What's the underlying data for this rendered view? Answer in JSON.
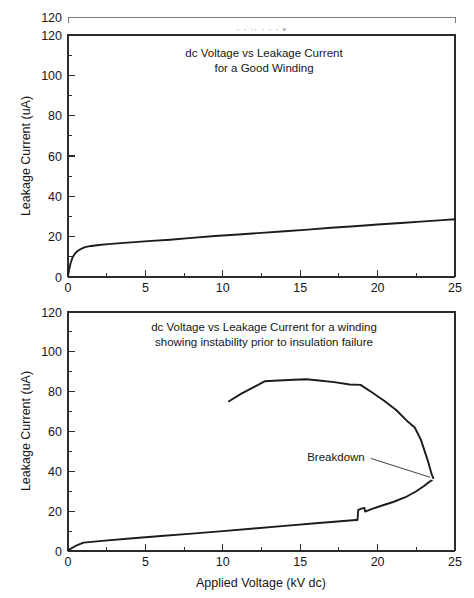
{
  "figure": {
    "background": "#ffffff",
    "ink_color": "#1c1c1c",
    "panel_count": 2
  },
  "chart_data": [
    {
      "type": "line",
      "id": "good-winding",
      "title": "dc Voltage vs Leakage Current\nfor a Good Winding",
      "title_line1": "dc Voltage vs Leakage Current",
      "title_line2": "for a Good Winding",
      "xlabel": "",
      "ylabel": "Leakage Current (uA)",
      "xlim": [
        0,
        25
      ],
      "ylim": [
        0,
        120
      ],
      "xticks": [
        0,
        5,
        10,
        15,
        20,
        25
      ],
      "xticklabels": [
        "0",
        "5",
        "10",
        "15",
        "20",
        "25"
      ],
      "yticks": [
        0,
        20,
        40,
        60,
        80,
        100,
        120
      ],
      "yticklabels": [
        "0",
        "20",
        "40",
        "60",
        "80",
        "100",
        "120"
      ],
      "minor_xticks": [
        2.5,
        7.5,
        12.5,
        17.5,
        22.5
      ],
      "minor_yticks": [
        10,
        30,
        50,
        70,
        90,
        110
      ],
      "grid": false,
      "legend": null,
      "series": [
        {
          "name": "Good winding leakage current",
          "x": [
            0.0,
            0.08,
            0.18,
            0.3,
            0.45,
            0.62,
            0.85,
            1.1,
            1.5,
            2.0,
            2.6,
            3.4,
            4.3,
            5.4,
            6.6,
            8.0,
            9.5,
            11.0,
            12.5,
            14.0,
            15.5,
            17.0,
            18.5,
            20.0,
            21.5,
            23.0,
            24.2,
            25.0
          ],
          "y": [
            0.4,
            4.0,
            7.2,
            9.8,
            11.6,
            12.9,
            14.0,
            14.8,
            15.4,
            15.9,
            16.3,
            16.8,
            17.3,
            17.9,
            18.5,
            19.4,
            20.3,
            21.1,
            21.9,
            22.7,
            23.5,
            24.4,
            25.2,
            26.0,
            26.8,
            27.6,
            28.2,
            28.6
          ]
        }
      ]
    },
    {
      "type": "line",
      "id": "unstable-winding",
      "title": "dc Voltage vs Leakage Current for a winding\nshowing instability prior to insulation failure",
      "title_line1": "dc Voltage vs Leakage Current for a winding",
      "title_line2": "showing instability prior to insulation failure",
      "xlabel": "Applied Voltage (kV dc)",
      "ylabel": "Leakage Current (uA)",
      "xlim": [
        0,
        25
      ],
      "ylim": [
        0,
        120
      ],
      "xticks": [
        0,
        5,
        10,
        15,
        20,
        25
      ],
      "xticklabels": [
        "0",
        "5",
        "10",
        "15",
        "20",
        "25"
      ],
      "yticks": [
        0,
        20,
        40,
        60,
        80,
        100,
        120
      ],
      "yticklabels": [
        "0",
        "20",
        "40",
        "60",
        "80",
        "100",
        "120"
      ],
      "minor_xticks": [
        2.5,
        7.5,
        12.5,
        17.5,
        22.5
      ],
      "minor_yticks": [
        10,
        30,
        50,
        70,
        90,
        110
      ],
      "grid": false,
      "legend": null,
      "annotations": [
        {
          "text": "Breakdown",
          "x": 19.3,
          "y": 45.0,
          "points_to_x": 23.4,
          "points_to_y": 37.0
        }
      ],
      "series": [
        {
          "name": "Lower branch - rising leakage with instability step",
          "x": [
            0.0,
            0.45,
            1.0,
            2.2,
            4.0,
            6.0,
            8.0,
            10.0,
            12.0,
            14.0,
            16.0,
            17.6,
            18.6,
            18.7,
            18.75,
            19.0,
            19.15,
            19.2,
            19.6,
            20.2,
            21.0,
            21.8,
            22.5,
            23.0,
            23.35,
            23.5
          ],
          "y": [
            0.3,
            2.4,
            4.2,
            5.1,
            6.3,
            7.5,
            8.7,
            10.0,
            11.3,
            12.6,
            13.9,
            14.9,
            15.6,
            15.6,
            20.6,
            21.4,
            21.6,
            19.8,
            21.0,
            22.6,
            24.6,
            27.0,
            30.0,
            32.6,
            34.8,
            35.4
          ]
        },
        {
          "name": "Upper branch - collapse toward breakdown",
          "x": [
            10.4,
            11.2,
            12.0,
            12.7,
            13.6,
            14.6,
            15.4,
            16.2,
            17.2,
            18.2,
            18.9,
            19.6,
            20.4,
            21.2,
            22.0,
            22.4,
            22.8,
            23.2,
            23.5,
            23.6
          ],
          "y": [
            75.2,
            79.0,
            82.3,
            85.2,
            85.6,
            86.0,
            86.2,
            85.6,
            84.8,
            83.6,
            83.4,
            79.8,
            75.6,
            70.8,
            64.6,
            62.0,
            55.8,
            46.4,
            38.4,
            36.6
          ]
        }
      ]
    }
  ],
  "artifacts": {
    "note": "scan duplication: a second plot-frame top edge and faint ghost text appear above the first panel",
    "ghost_top_label": "120"
  }
}
